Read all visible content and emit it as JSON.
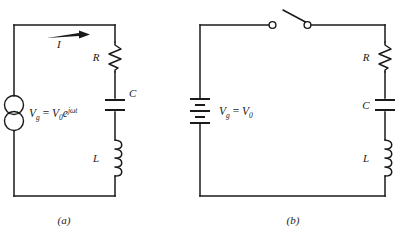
{
  "figure": {
    "background_color": "#ffffff",
    "line_color": "#1a1a1a"
  },
  "circuit_a": {
    "caption": "(a)",
    "source": {
      "type": "ac-generator",
      "symbol_name": "two-overlapping-circles",
      "label_v": "V",
      "label_v_sub": "g",
      "label_eq": "=",
      "label_v0": "V",
      "label_v0_sub": "0",
      "label_exp_base": "e",
      "label_exp": "jωt",
      "full_label": "V_g = V_0 e^{jωt}"
    },
    "current": {
      "label": "I",
      "direction": "right"
    },
    "components": [
      {
        "name": "resistor",
        "label": "R",
        "label_side": "left"
      },
      {
        "name": "capacitor",
        "label": "C",
        "label_side": "right"
      },
      {
        "name": "inductor",
        "label": "L",
        "label_side": "left"
      }
    ]
  },
  "circuit_b": {
    "caption": "(b)",
    "source": {
      "type": "battery",
      "symbol_name": "battery-cells",
      "label_v": "V",
      "label_v_sub": "g",
      "label_eq": "=",
      "label_v0": "V",
      "label_v0_sub": "0",
      "full_label": "V_g = V_0"
    },
    "switch": {
      "name": "open-switch",
      "state": "open"
    },
    "components": [
      {
        "name": "resistor",
        "label": "R",
        "label_side": "left"
      },
      {
        "name": "capacitor",
        "label": "C",
        "label_side": "left"
      },
      {
        "name": "inductor",
        "label": "L",
        "label_side": "left"
      }
    ]
  }
}
